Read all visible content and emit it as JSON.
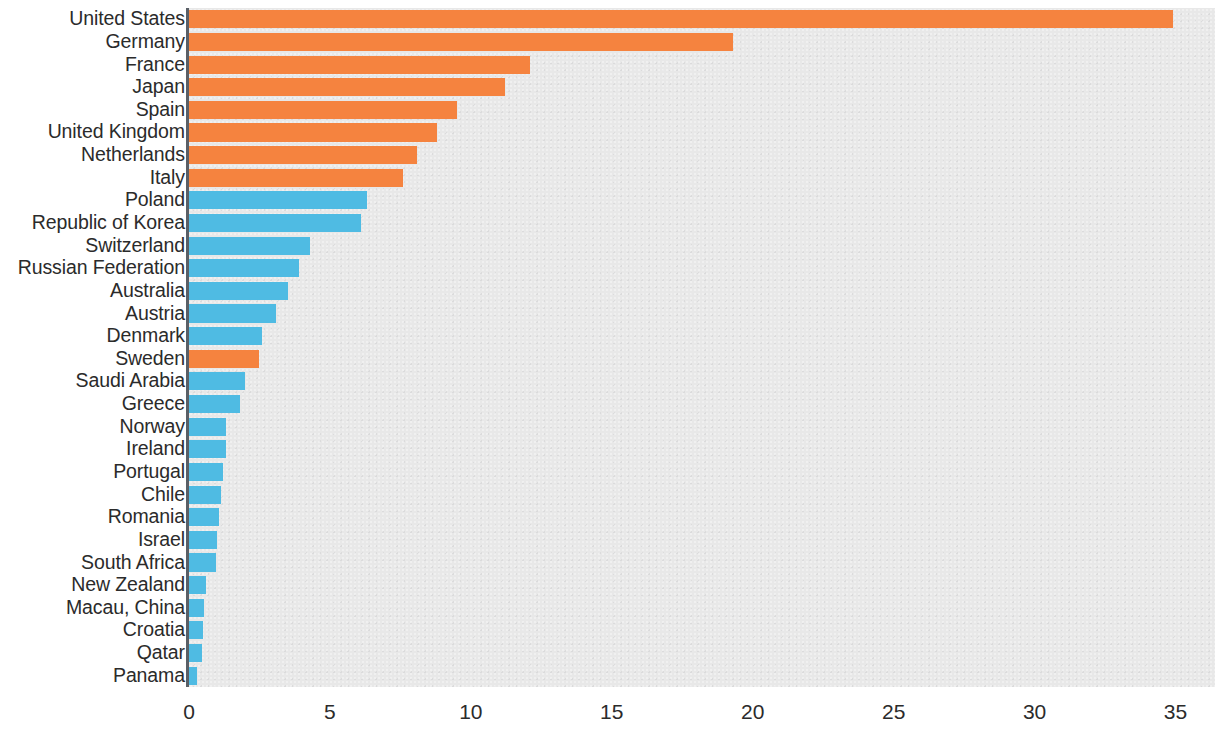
{
  "chart_data": {
    "type": "bar",
    "orientation": "horizontal",
    "title": "",
    "subtitle": "",
    "xlabel": "",
    "ylabel": "",
    "xlim": [
      0,
      36.4
    ],
    "ylim": null,
    "grid": false,
    "legend": null,
    "xticks": [
      0,
      5,
      10,
      15,
      20,
      25,
      30,
      35
    ],
    "xtick_labels": [
      "0",
      "5",
      "10",
      "15",
      "20",
      "25",
      "30",
      "35"
    ],
    "colors": {
      "orange": "#F5833F",
      "blue": "#4FBBE3",
      "plot_background": "#E8E8E8",
      "axis": "#5A5F66",
      "text": "#2B2B2B"
    },
    "categories": [
      "United States",
      "Germany",
      "France",
      "Japan",
      "Spain",
      "United Kingdom",
      "Netherlands",
      "Italy",
      "Poland",
      "Republic of Korea",
      "Switzerland",
      "Russian Federation",
      "Australia",
      "Austria",
      "Denmark",
      "Sweden",
      "Saudi Arabia",
      "Greece",
      "Norway",
      "Ireland",
      "Portugal",
      "Chile",
      "Romania",
      "Israel",
      "South Africa",
      "New Zealand",
      "Macau, China",
      "Croatia",
      "Qatar",
      "Panama"
    ],
    "values": [
      34.9,
      19.3,
      12.1,
      11.2,
      9.5,
      8.8,
      8.1,
      7.6,
      6.3,
      6.1,
      4.3,
      3.9,
      3.5,
      3.1,
      2.6,
      2.5,
      2.0,
      1.8,
      1.3,
      1.3,
      1.2,
      1.15,
      1.05,
      1.0,
      0.95,
      0.6,
      0.52,
      0.48,
      0.45,
      0.3
    ],
    "bar_colors": [
      "orange",
      "orange",
      "orange",
      "orange",
      "orange",
      "orange",
      "orange",
      "orange",
      "blue",
      "blue",
      "blue",
      "blue",
      "blue",
      "blue",
      "blue",
      "orange",
      "blue",
      "blue",
      "blue",
      "blue",
      "blue",
      "blue",
      "blue",
      "blue",
      "blue",
      "blue",
      "blue",
      "blue",
      "blue",
      "blue"
    ]
  }
}
